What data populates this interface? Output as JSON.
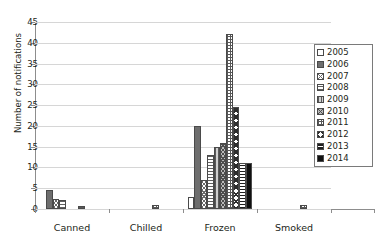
{
  "chart_data": {
    "type": "bar",
    "title": "",
    "xlabel": "",
    "ylabel": "Number of notifications",
    "ylim": [
      0,
      45
    ],
    "ytick_step": 5,
    "yticks": [
      0,
      5,
      10,
      15,
      20,
      25,
      30,
      35,
      40,
      45
    ],
    "grid": "horizontal",
    "legend_position": "right",
    "categories": [
      "Canned",
      "Chilled",
      "Frozen",
      "Smoked"
    ],
    "series": [
      {
        "name": "2005",
        "values": [
          0,
          0,
          3,
          0
        ]
      },
      {
        "name": "2006",
        "values": [
          4.5,
          0,
          20,
          0
        ]
      },
      {
        "name": "2007",
        "values": [
          2.5,
          0,
          7,
          0
        ]
      },
      {
        "name": "2008",
        "values": [
          2.2,
          0,
          13,
          0
        ]
      },
      {
        "name": "2009",
        "values": [
          0,
          0,
          15,
          0
        ]
      },
      {
        "name": "2010",
        "values": [
          0,
          0,
          16,
          0
        ]
      },
      {
        "name": "2011",
        "values": [
          0.7,
          1,
          42,
          1
        ]
      },
      {
        "name": "2012",
        "values": [
          0,
          0,
          24.5,
          0
        ]
      },
      {
        "name": "2013",
        "values": [
          0,
          0,
          11,
          0
        ]
      },
      {
        "name": "2014",
        "values": [
          0,
          0,
          11,
          0
        ]
      }
    ]
  },
  "axis": {
    "y_title": "Number of notifications",
    "y_tick_labels": [
      "0",
      "5",
      "10",
      "15",
      "20",
      "25",
      "30",
      "35",
      "40",
      "45"
    ],
    "x_tick_labels": [
      "Canned",
      "Chilled",
      "Frozen",
      "Smoked"
    ]
  },
  "legend": {
    "items": [
      {
        "label": "2005",
        "pattern": "empty-white"
      },
      {
        "label": "2006",
        "pattern": "solid-dark-gray"
      },
      {
        "label": "2007",
        "pattern": "fine-crosshatch"
      },
      {
        "label": "2008",
        "pattern": "horizontal-lines"
      },
      {
        "label": "2009",
        "pattern": "vertical-lines-gray"
      },
      {
        "label": "2010",
        "pattern": "diagonal-crosshatch-gray"
      },
      {
        "label": "2011",
        "pattern": "grid-crosshatch"
      },
      {
        "label": "2012",
        "pattern": "coarse-crosshatch"
      },
      {
        "label": "2013",
        "pattern": "dense-horizontal-lines"
      },
      {
        "label": "2014",
        "pattern": "solid-black"
      }
    ]
  },
  "colors": {
    "axis": "#8d8d8d",
    "gridline": "#d6d6d6",
    "text": "#231f20",
    "bar_outline": "#4a4a4a",
    "background": "#ffffff"
  }
}
